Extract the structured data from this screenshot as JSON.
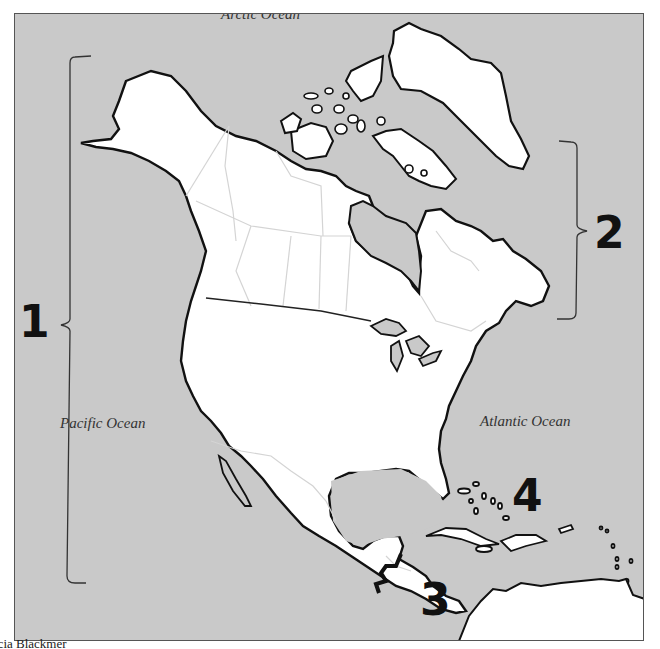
{
  "map": {
    "title": "North America regions map",
    "oceans": {
      "arctic": "Arctic Ocean",
      "pacific": "Pacific Ocean",
      "atlantic": "Atlantic Ocean"
    },
    "region_labels": [
      {
        "id": "1",
        "label": "1",
        "bracket": "left, Alaska to Central America"
      },
      {
        "id": "2",
        "label": "2",
        "bracket": "right, Greenland to Atlantic Canada"
      },
      {
        "id": "3",
        "label": "3",
        "bracket": "Central America"
      },
      {
        "id": "4",
        "label": "4",
        "bracket": "Caribbean islands"
      }
    ],
    "colors": {
      "water": "#c9c9c9",
      "land": "#ffffff",
      "coastline": "#111111",
      "borders": "#d4d4d4"
    }
  },
  "caption": "icia Blackmer"
}
